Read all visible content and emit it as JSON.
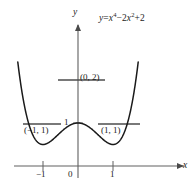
{
  "figure": {
    "equation_plain": "y = x^4 - 2x^2 + 2",
    "equation_parts": {
      "lhs": "y",
      "equals": "=",
      "term1_base": "x",
      "term1_exp": "4",
      "minus": "−",
      "term2_coef": "2",
      "term2_base": "x",
      "term2_exp": "2",
      "plus": "+",
      "term3": "2"
    },
    "axis_labels": {
      "x": "x",
      "y": "y"
    },
    "point_labels": [
      {
        "name": "local-max",
        "text": "(0, 2)"
      },
      {
        "name": "left-min",
        "text": "(−1, 1)"
      },
      {
        "name": "right-min",
        "text": "(1, 1)"
      }
    ],
    "tick_labels": {
      "y": [
        "1"
      ],
      "x": [
        "−1",
        "0",
        "1"
      ]
    },
    "colors": {
      "curve": "#1a1a1a",
      "axis": "#555555",
      "tangent": "#4d4d4d",
      "text": "#1c1c1c",
      "background": "#ffffff"
    }
  },
  "chart_data": {
    "type": "line",
    "title": "",
    "subtitle": "",
    "xlabel": "x",
    "ylabel": "y",
    "equation": "y = x^4 - 2x^2 + 2",
    "xlim": [
      -1.72,
      1.72
    ],
    "ylim": [
      -0.35,
      6.8
    ],
    "grid": false,
    "legend": "none",
    "xticks": [
      -1,
      0,
      1
    ],
    "xticklabels": [
      "−1",
      "0",
      "1"
    ],
    "yticks": [
      1
    ],
    "yticklabels": [
      "1"
    ],
    "annotations": [
      {
        "label": "(0, 2)",
        "x": 0,
        "y": 2,
        "type": "local-maximum"
      },
      {
        "label": "(−1, 1)",
        "x": -1,
        "y": 1,
        "type": "local-minimum"
      },
      {
        "label": "(1, 1)",
        "x": 1,
        "y": 1,
        "type": "local-minimum"
      }
    ],
    "tangent_lines": [
      {
        "at_x": 0,
        "at_y": 2,
        "slope": 0,
        "x_from": -0.95,
        "x_to": 0.78
      },
      {
        "at_x": -1,
        "at_y": 1,
        "slope": 0,
        "x_from": -1.56,
        "x_to": -0.47
      },
      {
        "at_x": 1,
        "at_y": 1,
        "slope": 0,
        "x_from": 0.57,
        "x_to": 1.78
      }
    ],
    "x": [
      -1.62,
      -1.5,
      -1.4,
      -1.3,
      -1.2,
      -1.1,
      -1.0,
      -0.9,
      -0.8,
      -0.7,
      -0.6,
      -0.5,
      -0.4,
      -0.3,
      -0.2,
      -0.1,
      0.0,
      0.1,
      0.2,
      0.3,
      0.4,
      0.5,
      0.6,
      0.7,
      0.8,
      0.9,
      1.0,
      1.1,
      1.2,
      1.3,
      1.4,
      1.5,
      1.62
    ],
    "values": [
      5.64,
      4.06,
      3.92,
      2.48,
      1.19,
      1.04,
      1.0,
      1.03,
      1.13,
      1.26,
      1.41,
      1.56,
      1.71,
      1.84,
      1.93,
      1.98,
      2.0,
      1.98,
      1.93,
      1.84,
      1.71,
      1.56,
      1.41,
      1.26,
      1.13,
      1.03,
      1.0,
      1.04,
      1.19,
      1.48,
      1.92,
      2.56,
      3.64
    ]
  }
}
